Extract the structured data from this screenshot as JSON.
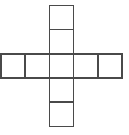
{
  "figure": {
    "shape_name": "cross-shaped polyomino",
    "square_count": 9,
    "background_color": "#ffffff",
    "line_color": "#4a4a4a",
    "line_width": 1.6,
    "fill_color": "#ffffff"
  },
  "geometry": {
    "cell_size": 24.2,
    "grid_columns": 5,
    "grid_rows": 5,
    "origin_x": 1.0,
    "origin_y": 5.3,
    "row_strip": {
      "label": "horizontal row of five squares",
      "count": 5,
      "row_index": 2,
      "column_indices": [
        0,
        1,
        2,
        3,
        4
      ]
    },
    "column_strip": {
      "label": "vertical column of five squares",
      "count": 5,
      "column_index": 2,
      "row_indices": [
        0,
        1,
        2,
        3,
        4
      ]
    }
  },
  "cells": [
    {
      "id": "cell-top-outer",
      "name": "top outer square",
      "col": 2,
      "row": 0
    },
    {
      "id": "cell-top-inner",
      "name": "top inner square",
      "col": 2,
      "row": 1
    },
    {
      "id": "cell-row-1",
      "name": "row square one (leftmost)",
      "col": 0,
      "row": 2
    },
    {
      "id": "cell-row-2",
      "name": "row square two",
      "col": 1,
      "row": 2
    },
    {
      "id": "cell-center",
      "name": "center square",
      "col": 2,
      "row": 2
    },
    {
      "id": "cell-row-4",
      "name": "row square four",
      "col": 3,
      "row": 2
    },
    {
      "id": "cell-row-5",
      "name": "row square five (rightmost)",
      "col": 4,
      "row": 2
    },
    {
      "id": "cell-bottom-inner",
      "name": "bottom inner square",
      "col": 2,
      "row": 3
    },
    {
      "id": "cell-bottom-outer",
      "name": "bottom outer square",
      "col": 2,
      "row": 4
    }
  ]
}
